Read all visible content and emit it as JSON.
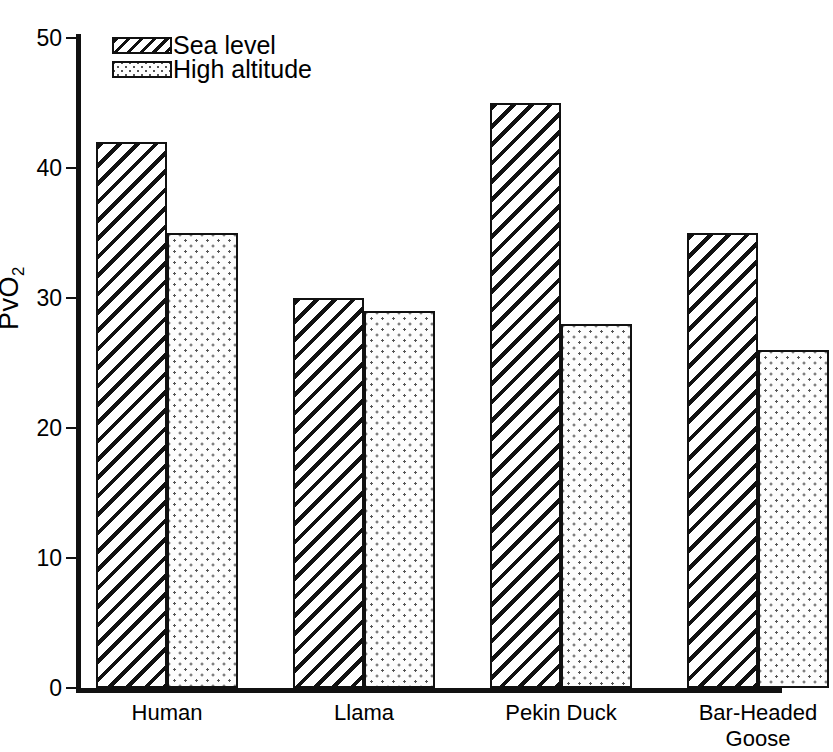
{
  "chart_data": {
    "type": "bar",
    "title": "",
    "xlabel": "",
    "ylabel": "PvO2",
    "ylabel_display": "P̄vO₂",
    "ylim": [
      0,
      50
    ],
    "yticks": [
      0,
      10,
      20,
      30,
      40,
      50
    ],
    "ytick_labels": [
      "0",
      "10",
      "20",
      "30",
      "40",
      "50"
    ],
    "grid": false,
    "legend_position": "top-left inside plot",
    "categories": [
      "Human",
      "Llama",
      "Pekin Duck",
      "Bar-Headed\nGoose"
    ],
    "category_labels_flat": [
      "Human",
      "Llama",
      "Pekin Duck",
      "Bar-Headed Goose"
    ],
    "series": [
      {
        "name": "Sea level",
        "pattern": "diagonal-hatch",
        "values": [
          42,
          30,
          45,
          35
        ]
      },
      {
        "name": "High altitude",
        "pattern": "dotted",
        "values": [
          35,
          29,
          28,
          26
        ]
      }
    ],
    "colors": {
      "axis": "#111111",
      "bar_outline": "#111111",
      "bar_fill": "#ffffff",
      "hatch": "#111111",
      "dots": "#555555",
      "background": "#ffffff"
    }
  },
  "legend": {
    "items": [
      {
        "label": "Sea level",
        "swatch": "hatch-swatch"
      },
      {
        "label": "High altitude",
        "swatch": "dots-swatch"
      }
    ]
  },
  "axis": {
    "y_title_p": "P",
    "y_title_v": "v",
    "y_title_o": "O",
    "y_title_sub": "2"
  }
}
